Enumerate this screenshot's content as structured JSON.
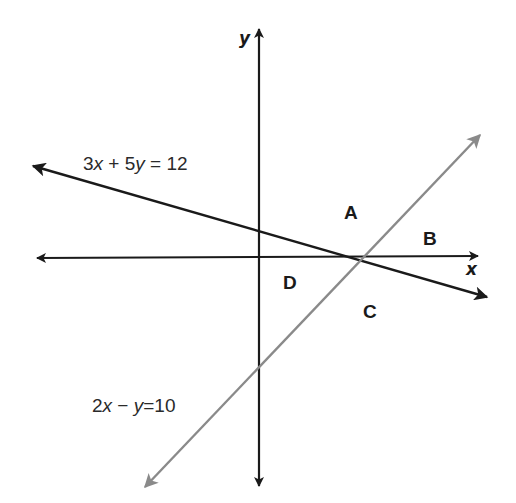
{
  "diagram": {
    "type": "coordinate-plane-with-two-lines",
    "axes": {
      "x_label": "x",
      "y_label": "y",
      "color": "#1a1a1a"
    },
    "lines": [
      {
        "id": "line-1",
        "equation": "3x + 5y = 12",
        "equation_parts": {
          "a": "3",
          "v1": "x",
          "op": "+",
          "b": "5",
          "v2": "y",
          "eq": "=",
          "c": "12"
        },
        "color": "#1a1a1a"
      },
      {
        "id": "line-2",
        "equation": "2x − y = 10",
        "equation_parts": {
          "a": "2",
          "v1": "x",
          "op": "−",
          "b": "",
          "v2": "y",
          "eq": "=",
          "c": "10"
        },
        "color": "#8a8a8a"
      }
    ],
    "regions": [
      {
        "label": "A"
      },
      {
        "label": "B"
      },
      {
        "label": "C"
      },
      {
        "label": "D"
      }
    ]
  }
}
